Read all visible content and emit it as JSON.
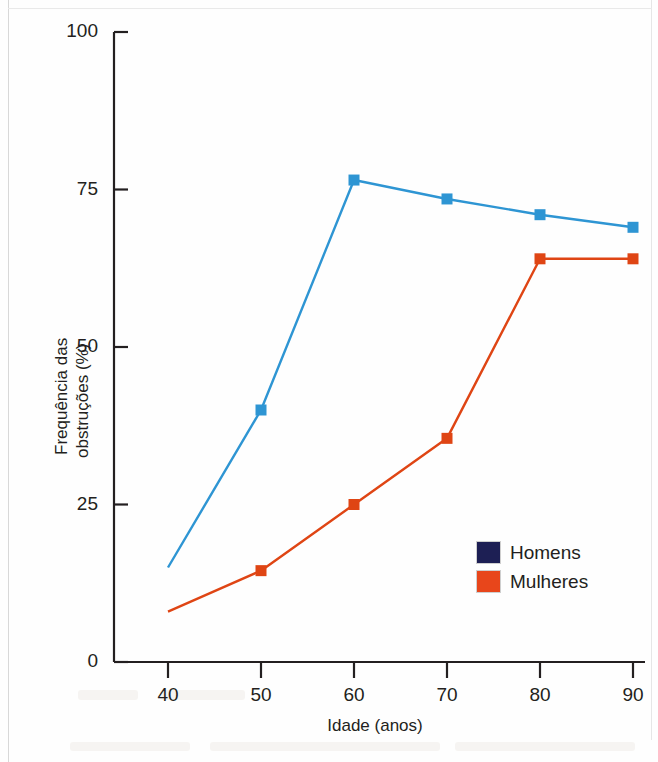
{
  "chart_data": {
    "type": "line",
    "title": "",
    "xlabel": "Idade (anos)",
    "ylabel": "Frequência das obstruções (%)",
    "ylabel_line1": "Frequência das",
    "ylabel_line2": "obstruções (%)",
    "x": [
      40,
      50,
      60,
      70,
      80,
      90
    ],
    "xticklabels": [
      "40",
      "50",
      "60",
      "70",
      "80",
      "90"
    ],
    "yticklabels": [
      "0",
      "25",
      "50",
      "75",
      "100"
    ],
    "yticks": [
      0,
      25,
      50,
      75,
      100
    ],
    "xlim": [
      35,
      92
    ],
    "ylim": [
      0,
      100
    ],
    "grid": false,
    "legend_position": "inside-lower-right",
    "series": [
      {
        "name": "Homens",
        "color": "#2e95d3",
        "legend_swatch_color": "#1d1f54",
        "marker": "square",
        "values": [
          15,
          40,
          76.5,
          73.5,
          71,
          69
        ],
        "marker_at_first_point": false
      },
      {
        "name": "Mulheres",
        "color": "#df4514",
        "legend_swatch_color": "#e8461b",
        "marker": "square",
        "values": [
          8,
          14.5,
          25,
          35.5,
          64,
          64
        ],
        "marker_at_first_point": false
      }
    ]
  },
  "legend": {
    "items": [
      {
        "label": "Homens"
      },
      {
        "label": "Mulheres"
      }
    ]
  },
  "axes": {
    "x_title": "Idade (anos)",
    "y_title_line1": "Frequência das",
    "y_title_line2": "obstruções (%)"
  },
  "colors": {
    "series_men_line": "#2e95d3",
    "series_women_line": "#df4514",
    "legend_men_swatch": "#1d1f54",
    "legend_women_swatch": "#e8461b",
    "axis": "#231f20",
    "background": "#fefefe"
  }
}
